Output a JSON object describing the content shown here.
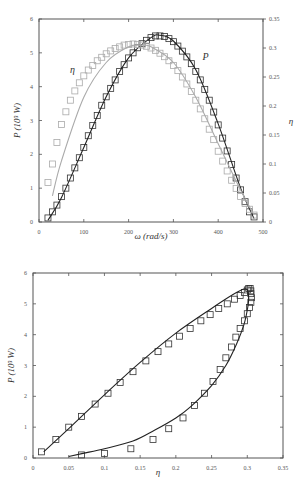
{
  "chart_data": [
    {
      "type": "scatter",
      "title": "",
      "xlabel": "ω (rad/s)",
      "ylabel": "P (10³ W)",
      "ylabel_right": "η",
      "xlim": [
        0,
        500
      ],
      "ylim": [
        0,
        6
      ],
      "ylim_right": [
        0,
        0.35
      ],
      "xticks": [
        0,
        100,
        200,
        300,
        400,
        500
      ],
      "yticks": [
        0,
        1,
        2,
        3,
        4,
        5,
        6
      ],
      "yticks_right": [
        0,
        0.05,
        0.1,
        0.15,
        0.2,
        0.25,
        0.3,
        0.35
      ],
      "grid": false,
      "annotations": [
        {
          "text": "η",
          "x": 75,
          "y": 4.4
        },
        {
          "text": "P",
          "x": 372,
          "y": 4.8
        }
      ],
      "series": [
        {
          "name": "P (measured)",
          "axis": "left",
          "marker": "square",
          "color": "#333333",
          "x": [
            20,
            30,
            40,
            50,
            60,
            70,
            80,
            90,
            100,
            110,
            120,
            130,
            140,
            150,
            160,
            170,
            180,
            190,
            200,
            210,
            220,
            230,
            240,
            250,
            260,
            270,
            280,
            290,
            300,
            310,
            320,
            330,
            340,
            350,
            360,
            370,
            380,
            390,
            400,
            410,
            420,
            430,
            440,
            450,
            460,
            470,
            480
          ],
          "y": [
            0.12,
            0.3,
            0.5,
            0.75,
            1.0,
            1.3,
            1.6,
            1.9,
            2.2,
            2.55,
            2.85,
            3.15,
            3.45,
            3.7,
            3.95,
            4.2,
            4.45,
            4.65,
            4.85,
            5.0,
            5.15,
            5.27,
            5.37,
            5.45,
            5.5,
            5.5,
            5.48,
            5.42,
            5.33,
            5.2,
            5.05,
            4.88,
            4.68,
            4.45,
            4.2,
            3.92,
            3.6,
            3.25,
            2.87,
            2.48,
            2.1,
            1.7,
            1.3,
            0.95,
            0.6,
            0.3,
            0.15
          ]
        },
        {
          "name": "P (model)",
          "axis": "left",
          "marker": "line",
          "color": "#222222",
          "x": [
            20,
            50,
            100,
            150,
            200,
            250,
            270,
            300,
            350,
            400,
            450,
            480
          ],
          "y": [
            0.05,
            0.72,
            2.2,
            3.7,
            4.85,
            5.45,
            5.52,
            5.35,
            4.5,
            2.9,
            1.0,
            0.1
          ]
        },
        {
          "name": "η (measured)",
          "axis": "right",
          "marker": "square",
          "color": "#aaaaaa",
          "x": [
            20,
            30,
            40,
            50,
            60,
            70,
            80,
            90,
            100,
            110,
            120,
            130,
            140,
            150,
            160,
            170,
            180,
            190,
            200,
            210,
            220,
            230,
            240,
            250,
            260,
            270,
            280,
            290,
            300,
            310,
            320,
            330,
            340,
            350,
            360,
            370,
            380,
            390,
            400,
            410,
            420,
            430,
            440,
            450,
            460,
            470,
            480
          ],
          "y": [
            0.068,
            0.1,
            0.137,
            0.168,
            0.19,
            0.21,
            0.226,
            0.24,
            0.252,
            0.262,
            0.27,
            0.278,
            0.284,
            0.29,
            0.295,
            0.299,
            0.302,
            0.305,
            0.306,
            0.307,
            0.306,
            0.305,
            0.303,
            0.3,
            0.296,
            0.291,
            0.285,
            0.278,
            0.27,
            0.261,
            0.25,
            0.238,
            0.225,
            0.21,
            0.195,
            0.178,
            0.16,
            0.142,
            0.122,
            0.105,
            0.088,
            0.072,
            0.058,
            0.044,
            0.032,
            0.022,
            0.012
          ]
        },
        {
          "name": "η (model)",
          "axis": "right",
          "marker": "line",
          "color": "#aaaaaa",
          "x": [
            30,
            50,
            100,
            150,
            200,
            230,
            250,
            300,
            350,
            400,
            450,
            480
          ],
          "y": [
            0.045,
            0.105,
            0.215,
            0.275,
            0.302,
            0.305,
            0.302,
            0.275,
            0.215,
            0.135,
            0.055,
            0.012
          ]
        }
      ]
    },
    {
      "type": "scatter",
      "title": "",
      "xlabel": "η",
      "ylabel": "P (10³ W)",
      "xlim": [
        0,
        0.35
      ],
      "ylim": [
        0,
        6
      ],
      "xticks": [
        0,
        0.05,
        0.1,
        0.15,
        0.2,
        0.25,
        0.3,
        0.35
      ],
      "yticks": [
        0,
        1,
        2,
        3,
        4,
        5,
        6
      ],
      "grid": false,
      "series": [
        {
          "name": "measured",
          "marker": "square",
          "color": "#333333",
          "x": [
            0.012,
            0.032,
            0.05,
            0.068,
            0.087,
            0.105,
            0.122,
            0.14,
            0.158,
            0.175,
            0.19,
            0.205,
            0.22,
            0.235,
            0.248,
            0.26,
            0.272,
            0.282,
            0.29,
            0.296,
            0.3,
            0.302,
            0.304,
            0.305,
            0.305,
            0.306,
            0.305,
            0.303,
            0.3,
            0.296,
            0.29,
            0.284,
            0.278,
            0.27,
            0.262,
            0.252,
            0.24,
            0.226,
            0.21,
            0.19,
            0.168,
            0.137,
            0.1,
            0.068
          ],
          "y": [
            0.2,
            0.6,
            1.0,
            1.35,
            1.75,
            2.1,
            2.45,
            2.8,
            3.15,
            3.45,
            3.7,
            3.95,
            4.2,
            4.45,
            4.65,
            4.85,
            5.0,
            5.15,
            5.27,
            5.37,
            5.45,
            5.5,
            5.5,
            5.42,
            5.33,
            5.2,
            5.05,
            4.88,
            4.68,
            4.45,
            4.2,
            3.92,
            3.6,
            3.25,
            2.87,
            2.48,
            2.1,
            1.7,
            1.3,
            0.95,
            0.6,
            0.3,
            0.15,
            0.1
          ]
        },
        {
          "name": "model",
          "marker": "line",
          "color": "#222222",
          "x": [
            0.015,
            0.05,
            0.1,
            0.15,
            0.2,
            0.25,
            0.28,
            0.295,
            0.3,
            0.302,
            0.3,
            0.295,
            0.285,
            0.27,
            0.25,
            0.22,
            0.2,
            0.17,
            0.14,
            0.1,
            0.07,
            0.05
          ],
          "y": [
            0.2,
            0.95,
            2.05,
            3.1,
            4.05,
            4.85,
            5.3,
            5.48,
            5.45,
            5.2,
            4.8,
            4.3,
            3.7,
            3.0,
            2.35,
            1.65,
            1.3,
            0.9,
            0.55,
            0.3,
            0.15,
            0.05
          ]
        }
      ]
    }
  ]
}
